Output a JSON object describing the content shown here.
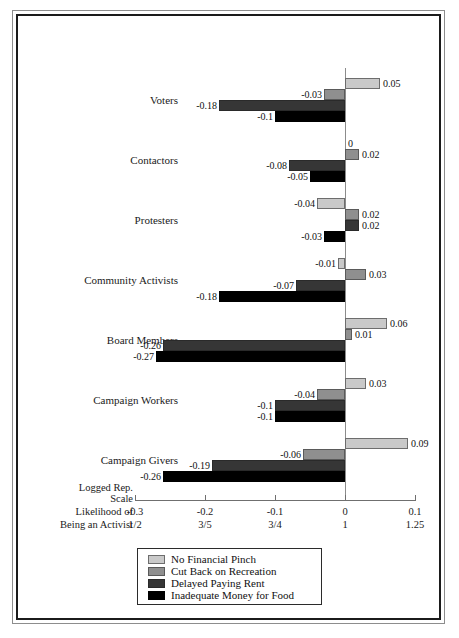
{
  "chart_data": {
    "type": "bar",
    "orientation": "horizontal",
    "title": "",
    "xlabel": "Logged Rep. Scale",
    "xlabel2": "Likelihood of Being an Activist",
    "ylabel": "",
    "grid": false,
    "legend_position": "bottom",
    "xlim": [
      -0.3,
      0.1
    ],
    "xticks": [
      -0.3,
      -0.2,
      -0.1,
      0,
      0.1
    ],
    "xtick_labels": [
      "-0.3",
      "-0.2",
      "-0.1",
      "0",
      "0.1"
    ],
    "xtick_labels_secondary": [
      "1/2",
      "3/5",
      "3/4",
      "1",
      "1.25"
    ],
    "categories": [
      "Voters",
      "Contactors",
      "Protesters",
      "Community Activists",
      "Board Members",
      "Campaign Workers",
      "Campaign Givers"
    ],
    "series": [
      {
        "name": "No Financial Pinch",
        "color": "#c9c9c9",
        "values": [
          0.05,
          0,
          -0.04,
          -0.01,
          0.06,
          0.03,
          0.09
        ],
        "labels": [
          "0.05",
          "0",
          "-0.04",
          "-0.01",
          "0.06",
          "0.03",
          "0.09"
        ]
      },
      {
        "name": "Cut Back on Recreation",
        "color": "#8f8f8f",
        "values": [
          -0.03,
          0.02,
          0.02,
          0.03,
          0.01,
          -0.04,
          -0.06
        ],
        "labels": [
          "-0.03",
          "0.02",
          "0.02",
          "0.03",
          "0.01",
          "-0.04",
          "-0.06"
        ]
      },
      {
        "name": "Delayed Paying Rent",
        "color": "#363636",
        "values": [
          -0.18,
          -0.08,
          0.02,
          -0.07,
          -0.26,
          -0.1,
          -0.19
        ],
        "labels": [
          "-0.18",
          "-0.08",
          "0.02",
          "-0.07",
          "-0.26",
          "-0.1",
          "-0.19"
        ]
      },
      {
        "name": "Inadequate Money for Food",
        "color": "#000000",
        "values": [
          -0.1,
          -0.05,
          -0.03,
          -0.18,
          -0.27,
          -0.1,
          -0.26
        ],
        "labels": [
          "-0.1",
          "-0.05",
          "-0.03",
          "-0.18",
          "-0.27",
          "-0.1",
          "-0.26"
        ]
      }
    ]
  },
  "axis": {
    "caption_line1": "Logged Rep.",
    "caption_line2": "Scale",
    "caption_line3": "Likelihood of",
    "caption_line4": "Being an Activist"
  }
}
